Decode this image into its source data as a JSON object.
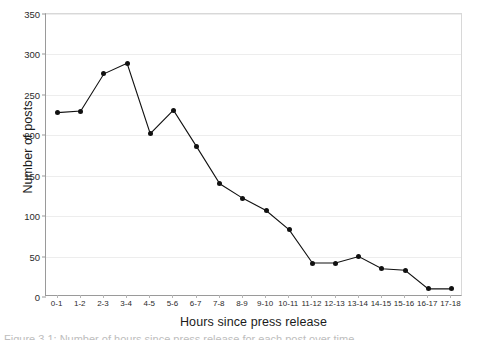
{
  "chart_data": {
    "type": "line",
    "title": "",
    "xlabel": "Hours since press release",
    "ylabel": "Number of posts",
    "categories": [
      "0-1",
      "1-2",
      "2-3",
      "3-4",
      "4-5",
      "5-6",
      "6-7",
      "7-8",
      "8-9",
      "9-10",
      "10-11",
      "11-12",
      "12-13",
      "13-14",
      "14-15",
      "15-16",
      "16-17",
      "17-18"
    ],
    "values": [
      228,
      230,
      276,
      289,
      202,
      231,
      186,
      140,
      122,
      107,
      83,
      42,
      42,
      50,
      35,
      33,
      10,
      10
    ],
    "ylim": [
      0,
      350
    ],
    "ytick_labels": [
      "0",
      "50",
      "100",
      "150",
      "200",
      "250",
      "300",
      "350"
    ],
    "ytick_values": [
      0,
      50,
      100,
      150,
      200,
      250,
      300,
      350
    ],
    "grid": true,
    "legend": false,
    "legend_position": "none",
    "series_color": "#111111",
    "grid_color": "#ededed",
    "axis_color": "#9a9a9a",
    "marker": "filled-circle"
  },
  "caption": {
    "text": "Figure 3.1: Number of hours since press release for each post over time"
  }
}
